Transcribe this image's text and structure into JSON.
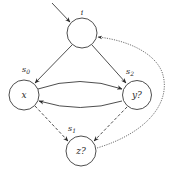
{
  "diagram": {
    "type": "state-transition-graph",
    "nodes": [
      {
        "id": "i",
        "label": "",
        "state_label": "i",
        "cx": 82,
        "cy": 33,
        "r": 15
      },
      {
        "id": "x",
        "label": "x",
        "state_label": "s0",
        "cx": 24,
        "cy": 95,
        "r": 15
      },
      {
        "id": "y",
        "label": "y?",
        "state_label": "s2",
        "cx": 137,
        "cy": 95,
        "r": 14.5
      },
      {
        "id": "z",
        "label": "z?",
        "state_label": "s1",
        "cx": 81,
        "cy": 151,
        "r": 15
      }
    ],
    "labels": {
      "top": "i",
      "s0": "s",
      "s0_sub": "0",
      "s1": "s",
      "s1_sub": "1",
      "s2": "s",
      "s2_sub": "2",
      "x_node": "x",
      "y_node": "y?",
      "z_node": "z?"
    },
    "edges": [
      {
        "from": "start",
        "to": "i",
        "style": "solid"
      },
      {
        "from": "i",
        "to": "x",
        "style": "solid"
      },
      {
        "from": "i",
        "to": "y",
        "style": "solid"
      },
      {
        "from": "x",
        "to": "y",
        "style": "solid",
        "curve": "up"
      },
      {
        "from": "y",
        "to": "x",
        "style": "solid",
        "curve": "down"
      },
      {
        "from": "x",
        "to": "z",
        "style": "dashed"
      },
      {
        "from": "y",
        "to": "z",
        "style": "dashed"
      },
      {
        "from": "z",
        "to": "i",
        "style": "dotted",
        "curve": "right-loop"
      }
    ],
    "colors": {
      "stroke": "#3a3a3a",
      "background": "#ffffff",
      "text": "#2a2a2a"
    }
  }
}
